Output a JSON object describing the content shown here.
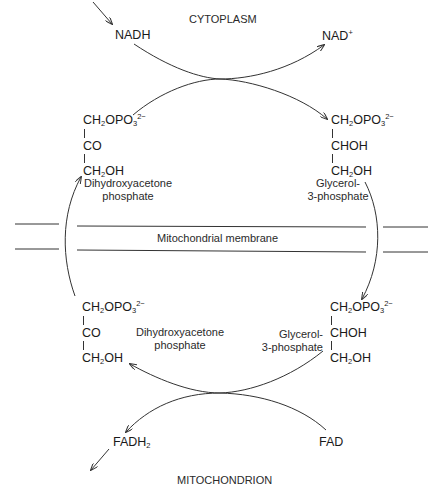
{
  "compartments": {
    "top": "CYTOPLASM",
    "bottom": "MITOCHONDRION",
    "membrane": "Mitochondrial membrane"
  },
  "cofactors": {
    "nadh": {
      "base": "NADH",
      "sub": "",
      "sup": ""
    },
    "nad": {
      "base": "NAD",
      "sub": "",
      "sup": "+"
    },
    "fadh2": {
      "base": "FADH",
      "sub": "2",
      "sup": ""
    },
    "fad": {
      "base": "FAD",
      "sub": "",
      "sup": ""
    }
  },
  "molecules": {
    "dhap": {
      "name_line1": "Dihydroxyacetone",
      "name_line2": "phosphate",
      "rows": [
        {
          "a": "CH",
          "s": "2",
          "b": "OPO",
          "s2": "3",
          "sup": "2−"
        },
        {
          "a": "CO"
        },
        {
          "a": "CH",
          "s": "2",
          "b": "OH"
        }
      ]
    },
    "g3p": {
      "name_line1": "Glycerol-",
      "name_line2": "3-phosphate",
      "rows": [
        {
          "a": "CH",
          "s": "2",
          "b": "OPO",
          "s2": "3",
          "sup": "2−"
        },
        {
          "a": "CHOH"
        },
        {
          "a": "CH",
          "s": "2",
          "b": "OH"
        }
      ]
    }
  },
  "colors": {
    "line": "#333333",
    "text": "#1a1a1a"
  }
}
